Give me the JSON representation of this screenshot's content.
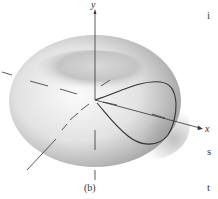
{
  "figure": {
    "panel_label": "(b)",
    "axes": {
      "x_label": "x",
      "y_label": "y"
    },
    "surface": "toroidal shaded surface with curve from origin",
    "colors": {
      "surface_light": "#f2f2f2",
      "surface_dark": "#9a9a9a",
      "line": "#333333"
    }
  },
  "edge_text": {
    "chars": [
      "i",
      "s",
      "t"
    ]
  }
}
